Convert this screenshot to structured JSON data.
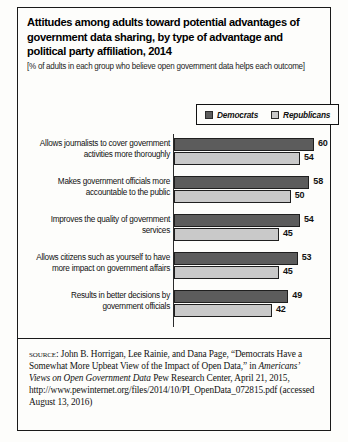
{
  "title": "Attitudes among adults toward potential advantages of government data sharing, by type of advantage and political party affiliation, 2014",
  "subtitle": "[% of adults in each group who believe open government data helps each outcome]",
  "legend": {
    "items": [
      {
        "label": "Democrats",
        "color": "#5c5c5c"
      },
      {
        "label": "Republicans",
        "color": "#c9c9c9"
      }
    ]
  },
  "source": {
    "kicker": "source:",
    "line1": " John B. Horrigan, Lee Rainie, and Dana Page, “Democrats Have a Somewhat More Upbeat View of the Impact of Open Data,” in ",
    "italic_title": "Americans’ Views on Open Government Data",
    "line2": " Pew Research Center, April 21, 2015, http://www.pewinternet.org/files/2014/10/PI_OpenData_072815.pdf (accessed August 13, 2016)"
  },
  "chart_data": {
    "type": "bar",
    "orientation": "horizontal",
    "title": "Attitudes among adults toward potential advantages of government data sharing, by type of advantage and political party affiliation, 2014",
    "subtitle": "[% of adults in each group who believe open government data helps each outcome]",
    "xlabel": "",
    "ylabel": "",
    "xlim": [
      0,
      60
    ],
    "grid": false,
    "legend_position": "top-right",
    "categories": [
      "Allows journalists to cover government activities more thoroughly",
      "Makes government officials more accountable to the public",
      "Improves the quality of government services",
      "Allows citizens such as yourself to have more impact on government affairs",
      "Results in better decisions by government officials"
    ],
    "category_lines": [
      [
        "Allows journalists to cover government",
        "activities more thoroughly"
      ],
      [
        "Makes government officials more",
        "accountable to the public"
      ],
      [
        "Improves the quality of government",
        "services"
      ],
      [
        "Allows citizens such as yourself to have",
        "more impact on government affairs"
      ],
      [
        "Results in better decisions by",
        "government officials"
      ]
    ],
    "series": [
      {
        "name": "Democrats",
        "color": "#5c5c5c",
        "values": [
          60,
          58,
          54,
          53,
          49
        ]
      },
      {
        "name": "Republicans",
        "color": "#c9c9c9",
        "values": [
          54,
          50,
          45,
          45,
          42
        ]
      }
    ]
  }
}
